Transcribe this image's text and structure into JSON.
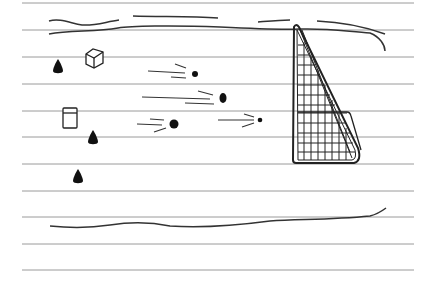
{
  "scene": {
    "description": "Hand-drawn sketch on lined paper: soccer field with goal net, balls in motion, cones and boxes",
    "colors": {
      "paper": "#ffffff",
      "ruled_line": "#9a9a9a",
      "ink": "#1a1a1a"
    },
    "ruled_lines_y": [
      3,
      30,
      57,
      84,
      111,
      137,
      164,
      191,
      217,
      244,
      270
    ],
    "elements": {
      "cones": [
        {
          "x": 58,
          "y": 66
        },
        {
          "x": 93,
          "y": 137
        },
        {
          "x": 78,
          "y": 177
        }
      ],
      "boxes": [
        {
          "x": 93,
          "y": 58,
          "style": "cube"
        },
        {
          "x": 70,
          "y": 117,
          "style": "box"
        }
      ],
      "balls": [
        {
          "x": 195,
          "y": 74,
          "r": 3
        },
        {
          "x": 223,
          "y": 98,
          "r": 4
        },
        {
          "x": 174,
          "y": 124,
          "r": 4
        },
        {
          "x": 260,
          "y": 120,
          "r": 2
        }
      ],
      "goal": {
        "icon": "soccer-goal-net"
      }
    }
  }
}
